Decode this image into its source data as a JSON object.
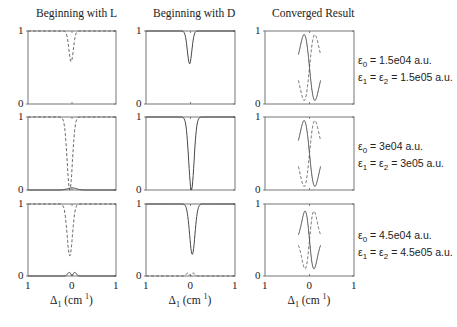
{
  "chart_data": {
    "type": "line",
    "layout": "3x3 grid of small multiples",
    "column_titles": [
      "Beginning with L",
      "Beginning with D",
      "Converged Result"
    ],
    "xlabel": "Δ1 (cm-1)",
    "xlabel_parts": {
      "symbol": "Δ",
      "sub": "1",
      "unit_open": "(cm",
      "sup": "1",
      "unit_close": ")"
    },
    "xticks": [
      "1",
      "0",
      "1"
    ],
    "xlim": [
      -1,
      1
    ],
    "yticks": [
      "0",
      "1"
    ],
    "ylim": [
      0,
      1
    ],
    "grid": false,
    "series_styles": {
      "solid": "#333333",
      "dashed": "#555555"
    },
    "rows": [
      {
        "annotation": {
          "line1": {
            "sym": "ε",
            "sub": "0",
            "rest": " = 1.5e04 a.u."
          },
          "line2": {
            "sym1": "ε",
            "sub1": "1",
            "mid": " = ",
            "sym2": "ε",
            "sub2": "2",
            "rest": " = 1.5e05 a.u."
          }
        },
        "panels": [
          {
            "curves": [
              {
                "style": "dashed",
                "kind": "dip",
                "center": -0.02,
                "base": 1.0,
                "depth": 0.42,
                "width": 0.05
              }
            ]
          },
          {
            "curves": [
              {
                "style": "solid",
                "kind": "dip",
                "center": -0.02,
                "base": 1.0,
                "depth": 0.45,
                "width": 0.05
              }
            ]
          },
          {
            "curves": [
              {
                "style": "solid",
                "kind": "wave",
                "center": 0.0,
                "base": 0.5,
                "amp": 0.45,
                "width": 0.12,
                "sign": 1,
                "extent": 0.5
              },
              {
                "style": "dashed",
                "kind": "wave",
                "center": 0.0,
                "base": 0.5,
                "amp": 0.45,
                "width": 0.12,
                "sign": -1,
                "extent": 0.5
              }
            ]
          }
        ]
      },
      {
        "annotation": {
          "line1": {
            "sym": "ε",
            "sub": "0",
            "rest": " = 3e04 a.u."
          },
          "line2": {
            "sym1": "ε",
            "sub1": "1",
            "mid": " = ",
            "sym2": "ε",
            "sub2": "2",
            "rest": " = 3e05 a.u."
          }
        },
        "panels": [
          {
            "curves": [
              {
                "style": "dashed",
                "kind": "dip",
                "center": -0.05,
                "base": 1.0,
                "depth": 1.0,
                "width": 0.06
              },
              {
                "style": "solid",
                "kind": "bump",
                "center": 0.0,
                "base": 0.0,
                "amp": 0.03,
                "width": 0.1
              }
            ]
          },
          {
            "curves": [
              {
                "style": "solid",
                "kind": "dip",
                "center": 0.02,
                "base": 1.0,
                "depth": 1.0,
                "width": 0.06
              }
            ]
          },
          {
            "curves": [
              {
                "style": "solid",
                "kind": "wave",
                "center": 0.0,
                "base": 0.5,
                "amp": 0.45,
                "width": 0.12,
                "sign": 1,
                "extent": 0.5
              },
              {
                "style": "dashed",
                "kind": "wave",
                "center": 0.0,
                "base": 0.5,
                "amp": 0.45,
                "width": 0.12,
                "sign": -1,
                "extent": 0.5
              }
            ]
          }
        ]
      },
      {
        "annotation": {
          "line1": {
            "sym": "ε",
            "sub": "0",
            "rest": " = 4.5e04 a.u."
          },
          "line2": {
            "sym1": "ε",
            "sub1": "1",
            "mid": " = ",
            "sym2": "ε",
            "sub2": "2",
            "rest": " = 4.5e05 a.u."
          }
        },
        "panels": [
          {
            "curves": [
              {
                "style": "dashed",
                "kind": "dip",
                "center": -0.05,
                "base": 1.0,
                "depth": 0.72,
                "width": 0.06
              },
              {
                "style": "solid",
                "kind": "doublebump",
                "center": 0.0,
                "base": 0.0,
                "amp": 0.05,
                "width": 0.08,
                "sep": 0.12
              }
            ]
          },
          {
            "curves": [
              {
                "style": "solid",
                "kind": "dip",
                "center": 0.04,
                "base": 1.0,
                "depth": 0.7,
                "width": 0.06
              },
              {
                "style": "dashed",
                "kind": "doublebump",
                "center": 0.0,
                "base": 0.0,
                "amp": 0.04,
                "width": 0.08,
                "sep": 0.12
              }
            ]
          },
          {
            "curves": [
              {
                "style": "solid",
                "kind": "wave",
                "center": 0.0,
                "base": 0.5,
                "amp": 0.4,
                "width": 0.1,
                "sign": 1,
                "extent": 0.5
              },
              {
                "style": "dashed",
                "kind": "wave",
                "center": 0.0,
                "base": 0.5,
                "amp": 0.4,
                "width": 0.1,
                "sign": -1,
                "extent": 0.5
              }
            ]
          }
        ]
      }
    ]
  }
}
